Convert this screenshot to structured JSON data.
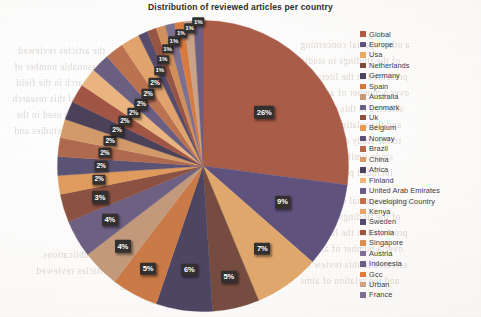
{
  "chart_data": {
    "type": "pie",
    "title": "Distribution of reviewed articles per country",
    "xlabel": "",
    "ylabel": "",
    "legend_position": "right",
    "grid": false,
    "value_suffix": "%",
    "categories": [
      "Global",
      "Europe",
      "Usa",
      "Netherlands",
      "Germany",
      "Spain",
      "Australia",
      "Denmark",
      "Uk",
      "Belgium",
      "Norway",
      "Brazil",
      "China",
      "Africa",
      "Finland",
      "United Arab Emirates",
      "Developing Country",
      "Kenya",
      "Sweden",
      "Estonia",
      "Singapore",
      "Austria",
      "Indonesia",
      "Gcc",
      "Urban",
      "France"
    ],
    "values": [
      26,
      9,
      7,
      5,
      6,
      5,
      4,
      4,
      3,
      2,
      2,
      2,
      2,
      2,
      2,
      2,
      2,
      2,
      2,
      1,
      1,
      1,
      1,
      1,
      1,
      1
    ],
    "labels": [
      "26%",
      "9%",
      "7%",
      "5%",
      "6%",
      "5%",
      "4%",
      "4%",
      "3%",
      "2%",
      "2%",
      "2%",
      "2%",
      "2%",
      "2%",
      "2%",
      "2%",
      "2%",
      "2%",
      "1%",
      "1%",
      "1%",
      "1%",
      "1%",
      "1%",
      "1%"
    ],
    "colors": [
      "#b05a42",
      "#5f5080",
      "#e7a866",
      "#7a4a3c",
      "#4d4363",
      "#d2793f",
      "#c79a77",
      "#6e5f86",
      "#8f4f3e",
      "#e79a55",
      "#5a5176",
      "#b5674a",
      "#d99a63",
      "#4a4059",
      "#a8523f",
      "#f0b57a",
      "#6a5c84",
      "#c2704b",
      "#e8a367",
      "#55496d",
      "#9b5340",
      "#d98f52",
      "#7d6e92",
      "#e07a3a",
      "#cfa284",
      "#6b5e85"
    ]
  },
  "legend": {
    "items": [
      {
        "label": "Global",
        "color": "#b05a42"
      },
      {
        "label": "Europe",
        "color": "#5f5080"
      },
      {
        "label": "Usa",
        "color": "#e7a866"
      },
      {
        "label": "Netherlands",
        "color": "#7a4a3c"
      },
      {
        "label": "Germany",
        "color": "#4d4363"
      },
      {
        "label": "Spain",
        "color": "#d2793f"
      },
      {
        "label": "Australia",
        "color": "#c79a77"
      },
      {
        "label": "Denmark",
        "color": "#6e5f86"
      },
      {
        "label": "Uk",
        "color": "#8f4f3e"
      },
      {
        "label": "Belgium",
        "color": "#e79a55"
      },
      {
        "label": "Norway",
        "color": "#5a5176"
      },
      {
        "label": "Brazil",
        "color": "#b5674a"
      },
      {
        "label": "China",
        "color": "#d99a63"
      },
      {
        "label": "Africa",
        "color": "#4a4059"
      },
      {
        "label": "Finland",
        "color": "#f0b57a"
      },
      {
        "label": "United Arab Emirates",
        "color": "#6a5c84"
      },
      {
        "label": "Developing Country",
        "color": "#c2704b"
      },
      {
        "label": "Kenya",
        "color": "#e8a367"
      },
      {
        "label": "Sweden",
        "color": "#55496d"
      },
      {
        "label": "Estonia",
        "color": "#9b5340"
      },
      {
        "label": "Singapore",
        "color": "#d98f52"
      },
      {
        "label": "Austria",
        "color": "#7d6e92"
      },
      {
        "label": "Indonesia",
        "color": "#6b5e85"
      },
      {
        "label": "Gcc",
        "color": "#e07a3a"
      },
      {
        "label": "Urban",
        "color": "#cfa284"
      },
      {
        "label": "France",
        "color": "#7d6e92"
      }
    ]
  },
  "ghost_text": {
    "lines": [
      "a other special concerning",
      "of the findings in studies",
      "presented in the literature",
      "over a number of articles",
      "selected in this review of",
      "and the relation of aims",
      "to the study design used",
      "study limitations in the",
      "included publications.",
      "the articles reviewed",
      "a reasonable number of",
      "the research in the field",
      "overview of this research",
      "has been used in the",
      "reviewed studies and"
    ]
  }
}
